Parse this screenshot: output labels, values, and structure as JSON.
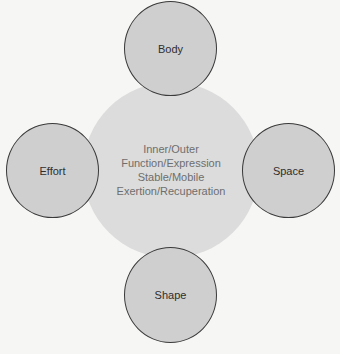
{
  "diagram": {
    "center": {
      "lines": [
        "Inner/Outer",
        "Function/Expression",
        "Stable/Mobile",
        "Exertion/Recuperation"
      ],
      "fill": "#dcdcdc"
    },
    "nodes": [
      {
        "label": "Body",
        "position": "top"
      },
      {
        "label": "Effort",
        "position": "left"
      },
      {
        "label": "Space",
        "position": "right"
      },
      {
        "label": "Shape",
        "position": "bottom"
      }
    ],
    "colors": {
      "background": "#f6f6f4",
      "node_fill": "#cfcfcf",
      "node_stroke": "#3a3a3a",
      "center_text": "#6e6e6e"
    }
  }
}
